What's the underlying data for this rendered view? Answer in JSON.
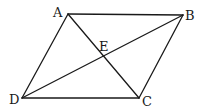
{
  "figure": {
    "type": "parallelogram-with-diagonals",
    "points": {
      "A": {
        "label": "A",
        "x": 68,
        "y": 14,
        "label_x": 53,
        "label_y": 17
      },
      "B": {
        "label": "B",
        "x": 183,
        "y": 15,
        "label_x": 185,
        "label_y": 20
      },
      "C": {
        "label": "C",
        "x": 139,
        "y": 98,
        "label_x": 142,
        "label_y": 106
      },
      "D": {
        "label": "D",
        "x": 22,
        "y": 98,
        "label_x": 9,
        "label_y": 104
      },
      "E": {
        "label": "E",
        "x": 104,
        "y": 58,
        "label_x": 99,
        "label_y": 51
      }
    },
    "segments": [
      {
        "name": "AB",
        "from": "A",
        "to": "B"
      },
      {
        "name": "BC",
        "from": "B",
        "to": "C"
      },
      {
        "name": "CD",
        "from": "C",
        "to": "D"
      },
      {
        "name": "DA",
        "from": "D",
        "to": "A"
      },
      {
        "name": "AC",
        "from": "A",
        "to": "C"
      },
      {
        "name": "BD",
        "from": "B",
        "to": "D"
      }
    ],
    "line_color": "#1a1a1a",
    "background": "#ffffff"
  }
}
